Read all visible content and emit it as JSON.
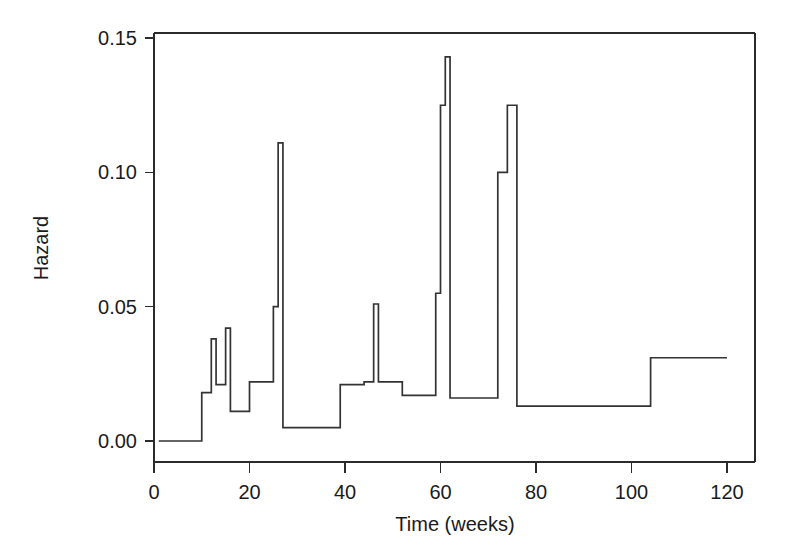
{
  "chart_data": {
    "type": "line",
    "subtype": "step-function-hazard",
    "title": "",
    "subtitle": "",
    "xlabel": "Time (weeks)",
    "ylabel": "Hazard",
    "xlim": [
      -2,
      126
    ],
    "ylim": [
      -0.006,
      0.1555
    ],
    "xticks": [
      0,
      20,
      40,
      60,
      80,
      100,
      120
    ],
    "xtick_labels": [
      "0",
      "20",
      "40",
      "60",
      "80",
      "100",
      "120"
    ],
    "yticks": [
      0.0,
      0.05,
      0.1,
      0.15
    ],
    "ytick_labels": [
      "0.00",
      "0.05",
      "0.10",
      "0.15"
    ],
    "grid": false,
    "legend": false,
    "legend_position": "none",
    "line_color": "#333333",
    "background_color": "#ffffff",
    "series": [
      {
        "name": "Hazard",
        "step_type": "post",
        "x": [
          1,
          10,
          12,
          13,
          14,
          15,
          16,
          17,
          20,
          22,
          25,
          26,
          27,
          38,
          40,
          44,
          46,
          47,
          48,
          52,
          54,
          58,
          60,
          61,
          62,
          72,
          73,
          74,
          75,
          76,
          77,
          104,
          120
        ],
        "y": [
          0.0,
          0.0,
          0.018,
          0.038,
          0.021,
          0.021,
          0.042,
          0.011,
          0.011,
          0.022,
          0.022,
          0.05,
          0.111,
          0.005,
          0.005,
          0.021,
          0.022,
          0.051,
          0.022,
          0.022,
          0.017,
          0.017,
          0.055,
          0.125,
          0.143,
          0.016,
          0.016,
          0.055,
          0.1,
          0.125,
          0.013,
          0.013,
          0.031
        ],
        "points": [
          {
            "x": 1,
            "y": 0.0
          },
          {
            "x": 10,
            "y": 0.0
          },
          {
            "x": 10,
            "y": 0.018
          },
          {
            "x": 12,
            "y": 0.018
          },
          {
            "x": 12,
            "y": 0.038
          },
          {
            "x": 13,
            "y": 0.038
          },
          {
            "x": 13,
            "y": 0.021
          },
          {
            "x": 15,
            "y": 0.021
          },
          {
            "x": 15,
            "y": 0.042
          },
          {
            "x": 16,
            "y": 0.042
          },
          {
            "x": 16,
            "y": 0.011
          },
          {
            "x": 20,
            "y": 0.011
          },
          {
            "x": 20,
            "y": 0.022
          },
          {
            "x": 25,
            "y": 0.022
          },
          {
            "x": 25,
            "y": 0.05
          },
          {
            "x": 26,
            "y": 0.05
          },
          {
            "x": 26,
            "y": 0.111
          },
          {
            "x": 27,
            "y": 0.111
          },
          {
            "x": 27,
            "y": 0.005
          },
          {
            "x": 39,
            "y": 0.005
          },
          {
            "x": 39,
            "y": 0.021
          },
          {
            "x": 44,
            "y": 0.021
          },
          {
            "x": 44,
            "y": 0.022
          },
          {
            "x": 46,
            "y": 0.022
          },
          {
            "x": 46,
            "y": 0.051
          },
          {
            "x": 47,
            "y": 0.051
          },
          {
            "x": 47,
            "y": 0.022
          },
          {
            "x": 52,
            "y": 0.022
          },
          {
            "x": 52,
            "y": 0.017
          },
          {
            "x": 59,
            "y": 0.017
          },
          {
            "x": 59,
            "y": 0.055
          },
          {
            "x": 60,
            "y": 0.055
          },
          {
            "x": 60,
            "y": 0.125
          },
          {
            "x": 61,
            "y": 0.125
          },
          {
            "x": 61,
            "y": 0.143
          },
          {
            "x": 62,
            "y": 0.143
          },
          {
            "x": 62,
            "y": 0.016
          },
          {
            "x": 72,
            "y": 0.016
          },
          {
            "x": 72,
            "y": 0.1
          },
          {
            "x": 74,
            "y": 0.1
          },
          {
            "x": 74,
            "y": 0.125
          },
          {
            "x": 76,
            "y": 0.125
          },
          {
            "x": 76,
            "y": 0.013
          },
          {
            "x": 104,
            "y": 0.013
          },
          {
            "x": 104,
            "y": 0.031
          },
          {
            "x": 120,
            "y": 0.031
          }
        ],
        "annotations": [
          {
            "label": "baseline-zero",
            "x_start": 1,
            "x_end": 10,
            "value": 0.0
          },
          {
            "label": "global-max",
            "x": 61,
            "value": 0.143
          },
          {
            "label": "secondary-max",
            "x": 74,
            "value": 0.125
          },
          {
            "label": "early-peak",
            "x": 26,
            "value": 0.111
          }
        ]
      }
    ]
  }
}
